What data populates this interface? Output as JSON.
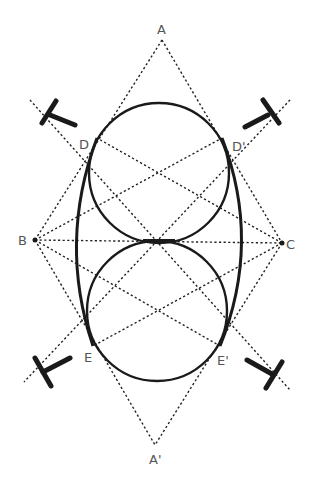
{
  "diagram": {
    "labels": {
      "A": "A",
      "A_prime": "A'",
      "B": "B",
      "C": "C",
      "D": "D",
      "D_prime": "D'",
      "E": "E",
      "E_prime": "E'"
    },
    "points": {
      "A": [
        162,
        40
      ],
      "A_prime": [
        155,
        445
      ],
      "B": [
        35,
        240
      ],
      "C": [
        282,
        243
      ],
      "D": [
        97,
        138
      ],
      "D_prime": [
        222,
        138
      ],
      "E": [
        93,
        346
      ],
      "E_prime": [
        220,
        346
      ]
    },
    "circles": [
      {
        "name": "upper-circle",
        "cx": 159,
        "cy": 173,
        "r": 70
      },
      {
        "name": "lower-circle",
        "cx": 157,
        "cy": 311,
        "r": 70
      }
    ],
    "icons": [
      "t-square-icon-top-left",
      "t-square-icon-top-right",
      "t-square-icon-bottom-left",
      "t-square-icon-bottom-right"
    ],
    "colors": {
      "line": "#1a1a1a",
      "label": "#555555",
      "background": "#ffffff"
    }
  }
}
